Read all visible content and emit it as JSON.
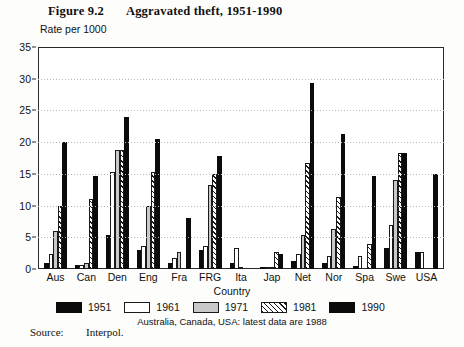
{
  "figure": {
    "number": "Figure 9.2",
    "title": "Aggravated theft, 1951-1990",
    "footnote": "Australia, Canada, USA: latest data are 1988",
    "source_label": "Source:",
    "source_value": "Interpol."
  },
  "chart_data": {
    "type": "bar",
    "title": "Aggravated theft, 1951-1990",
    "subtitle": "Rate per 1000",
    "xlabel": "Country",
    "ylabel": "Rate per 1000",
    "ylim": [
      0,
      35
    ],
    "yticks": [
      0,
      5,
      10,
      15,
      20,
      25,
      30,
      35
    ],
    "grid": true,
    "legend_position": "bottom",
    "categories": [
      "Aus",
      "Can",
      "Den",
      "Eng",
      "Fra",
      "FRG",
      "Ita",
      "Jap",
      "Net",
      "Nor",
      "Spa",
      "Swe",
      "USA"
    ],
    "series": [
      {
        "name": "1951",
        "color": "#0b0b0b",
        "fill": "solid-black",
        "values": [
          1.0,
          0.6,
          5.3,
          3.0,
          1.0,
          3.0,
          1.0,
          0.1,
          1.3,
          1.0,
          0.5,
          3.3,
          2.7
        ]
      },
      {
        "name": "1961",
        "color": "#ffffff",
        "fill": "white",
        "values": [
          2.3,
          0.7,
          15.3,
          3.7,
          1.7,
          3.7,
          3.3,
          0.1,
          2.3,
          2.0,
          2.0,
          7.0,
          2.7
        ]
      },
      {
        "name": "1971",
        "color": "#c9c9c9",
        "fill": "gray",
        "values": [
          6.0,
          1.0,
          18.7,
          10.0,
          2.7,
          13.3,
          0.3,
          0.2,
          5.3,
          6.3,
          0.0,
          14.0,
          0.0
        ]
      },
      {
        "name": "1981",
        "color": "#ffffff",
        "fill": "diagonal-hatch",
        "values": [
          10.0,
          11.0,
          18.7,
          15.3,
          0.0,
          15.0,
          0.0,
          2.7,
          16.7,
          11.3,
          4.0,
          18.3,
          0.0
        ]
      },
      {
        "name": "1990",
        "color": "#0b0b0b",
        "fill": "solid-black",
        "values": [
          20.0,
          14.7,
          24.0,
          20.5,
          8.0,
          17.8,
          0.0,
          2.3,
          29.3,
          21.3,
          14.7,
          18.3,
          15.0
        ]
      }
    ]
  }
}
